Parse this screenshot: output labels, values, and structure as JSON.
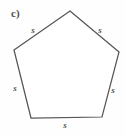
{
  "figure": {
    "part_label": "c)",
    "shape_name": "regular-pentagon",
    "stroke_color": "#565656",
    "background_color": "#fefefe",
    "label_color": "#4f4f4f",
    "vertices": [
      {
        "name": "apex",
        "x": 70,
        "y": 11
      },
      {
        "name": "upper-right",
        "x": 119,
        "y": 52
      },
      {
        "name": "lower-right",
        "x": 102,
        "y": 117
      },
      {
        "name": "lower-left",
        "x": 31,
        "y": 118
      },
      {
        "name": "upper-left",
        "x": 14,
        "y": 50
      }
    ],
    "side_labels": [
      {
        "name": "upper-left-side",
        "text": "s",
        "x": 33,
        "y": 30
      },
      {
        "name": "upper-right-side",
        "text": "s",
        "x": 100,
        "y": 30
      },
      {
        "name": "left-side",
        "text": "s",
        "x": 15,
        "y": 88
      },
      {
        "name": "right-side",
        "text": "s",
        "x": 113,
        "y": 90
      },
      {
        "name": "bottom-side",
        "text": "s",
        "x": 65,
        "y": 125
      }
    ]
  }
}
